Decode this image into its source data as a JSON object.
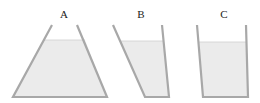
{
  "diagram": {
    "type": "containers-with-liquid",
    "colors": {
      "wall": "#a8a8a8",
      "liquid": "#ebebeb",
      "background": "#ffffff",
      "label": "#222222"
    },
    "containers": [
      {
        "label": "A",
        "shape": "trapezoid-wide-bottom",
        "label_pos": [
          64,
          18
        ],
        "walls": [
          [
            52,
            25
          ],
          [
            13,
            97
          ],
          [
            107,
            97
          ],
          [
            77,
            25
          ]
        ],
        "liquid": [
          [
            44,
            40
          ],
          [
            13,
            97
          ],
          [
            107,
            97
          ],
          [
            85,
            40
          ]
        ]
      },
      {
        "label": "B",
        "shape": "slanted-left-wall",
        "label_pos": [
          141,
          18
        ],
        "walls": [
          [
            113,
            25
          ],
          [
            145,
            97
          ],
          [
            169,
            97
          ],
          [
            162,
            25
          ]
        ],
        "liquid": [
          [
            120,
            41
          ],
          [
            145,
            97
          ],
          [
            169,
            97
          ],
          [
            163,
            41
          ]
        ]
      },
      {
        "label": "C",
        "shape": "near-rectangular",
        "label_pos": [
          224,
          18
        ],
        "walls": [
          [
            197,
            25
          ],
          [
            203,
            97
          ],
          [
            248,
            97
          ],
          [
            246,
            25
          ]
        ],
        "liquid": [
          [
            199,
            42
          ],
          [
            203,
            97
          ],
          [
            248,
            97
          ],
          [
            246,
            42
          ]
        ]
      }
    ]
  }
}
